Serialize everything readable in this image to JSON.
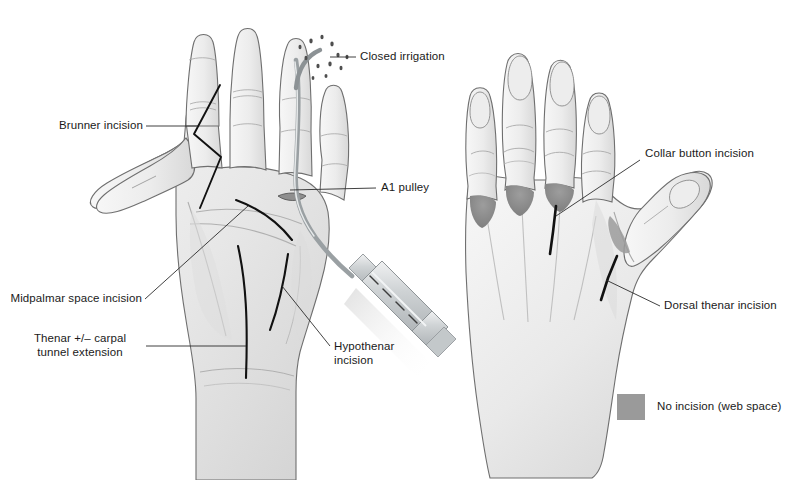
{
  "figure": {
    "kind": "medical-illustration",
    "background_color": "#ffffff",
    "text_color": "#1a1a1a",
    "leader_line_color": "#2b2b2b",
    "incision_color": "#111111",
    "web_space_marker_color": "#8e8e8e",
    "skin_fill_light": "#f2f2f2",
    "skin_fill_mid": "#e3e3e3",
    "skin_fill_shadow": "#cfcfcf",
    "skin_outline": "#6d6d6d",
    "instrument_color": "#c9cdcf"
  },
  "labels": {
    "closed_irrigation": "Closed irrigation",
    "brunner_incision": "Brunner incision",
    "a1_pulley": "A1 pulley",
    "midpalmar_space_incision": "Midpalmar space incision",
    "thenar_carpal_tunnel_line1": "Thenar +/– carpal",
    "thenar_carpal_tunnel_line2": "tunnel extension",
    "hypothenar_line1": "Hypothenar",
    "hypothenar_line2": "incision",
    "collar_button_incision": "Collar button incision",
    "dorsal_thenar_incision": "Dorsal thenar incision"
  },
  "legend": {
    "swatch_color": "#9a9a9a",
    "text": "No incision (web space)"
  },
  "views": {
    "left": {
      "name": "Palmar (volar) view of left hand",
      "features": [
        "Brunner zigzag incision on index finger",
        "A1 pulley with closed irrigation catheter",
        "Midpalmar space incision",
        "Thenar +/– carpal tunnel extension incision",
        "Hypothenar incision",
        "Irrigation syringe attached to catheter"
      ]
    },
    "right": {
      "name": "Dorsal view of right hand",
      "features": [
        "Collar button incision over third web space",
        "Dorsal thenar incision",
        "Three shaded web space markers (no incision)"
      ]
    }
  }
}
